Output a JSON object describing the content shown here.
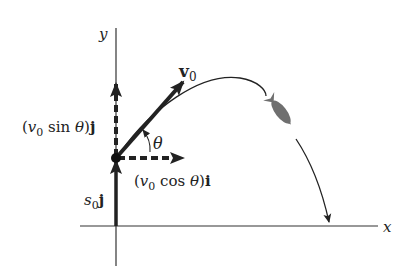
{
  "diagram": {
    "axes": {
      "x_label": "x",
      "y_label": "y"
    },
    "vectors": {
      "v0": {
        "label": "v",
        "sub": "0"
      },
      "vertical_component": {
        "open": "(",
        "v": "v",
        "sub": "0",
        "func": " sin ",
        "theta": "θ",
        "close": ")",
        "unit": "j"
      },
      "horizontal_component": {
        "open": "(",
        "v": "v",
        "sub": "0",
        "func": " cos ",
        "theta": "θ",
        "close": ")",
        "unit": "i"
      },
      "s0": {
        "s": "s",
        "sub": "0",
        "unit": "j"
      }
    },
    "angle_label": "θ",
    "colors": {
      "ink": "#222222",
      "rocket": "#6f6f6f",
      "background": "#ffffff"
    }
  }
}
